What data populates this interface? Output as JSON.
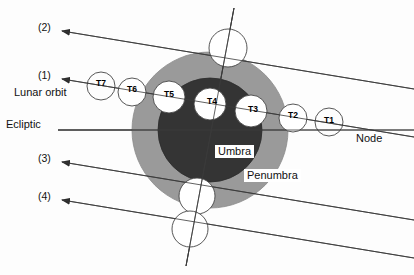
{
  "diagram": {
    "background_color": "#fdfdfd",
    "line_color": "#3a3a3a",
    "text_color": "#111111"
  },
  "regions": [
    {
      "id": "penumbra",
      "label": "Penumbra",
      "color": "#9a9a9a",
      "cx": 210,
      "cy": 130,
      "r": 78,
      "label_x": 244,
      "label_y": 176
    },
    {
      "id": "umbra",
      "label": "Umbra",
      "color": "#343434",
      "cx": 210,
      "cy": 130,
      "r": 52,
      "label_x": 215,
      "label_y": 152
    }
  ],
  "reference_lines": [
    {
      "id": "ecliptic",
      "label": "Ecliptic",
      "label_x": 6,
      "label_y": 124,
      "orientation": "horizontal"
    },
    {
      "id": "node",
      "label": "Node",
      "label_x": 356,
      "label_y": 138,
      "orientation": "on-lunar-orbit"
    },
    {
      "id": "lunar-orbit",
      "label": "Lunar orbit",
      "label_x": 14,
      "label_y": 92,
      "orientation": "tilted"
    }
  ],
  "callouts": [
    {
      "id": "callout-2",
      "label": "(2)",
      "label_x": 38,
      "label_y": 27,
      "arrow_x": 62,
      "arrow_y": 31
    },
    {
      "id": "callout-1",
      "label": "(1)",
      "label_x": 38,
      "label_y": 75,
      "arrow_x": 62,
      "arrow_y": 79
    },
    {
      "id": "callout-3",
      "label": "(3)",
      "label_x": 38,
      "label_y": 158,
      "arrow_x": 62,
      "arrow_y": 162
    },
    {
      "id": "callout-4",
      "label": "(4)",
      "label_x": 38,
      "label_y": 196,
      "arrow_x": 62,
      "arrow_y": 200
    }
  ],
  "moon_positions": [
    {
      "id": "T1",
      "label": "T1",
      "cx": 329,
      "cy": 122,
      "r": 14,
      "fill": "none"
    },
    {
      "id": "T2",
      "label": "T2",
      "cx": 293,
      "cy": 118,
      "r": 14,
      "fill": "white"
    },
    {
      "id": "T3",
      "label": "T3",
      "cx": 251,
      "cy": 111,
      "r": 16,
      "fill": "white"
    },
    {
      "id": "T4",
      "label": "T4",
      "cx": 210,
      "cy": 104,
      "r": 16,
      "fill": "white"
    },
    {
      "id": "T5",
      "label": "T5",
      "cx": 169,
      "cy": 97,
      "r": 16,
      "fill": "white"
    },
    {
      "id": "T6",
      "label": "T6",
      "cx": 132,
      "cy": 92,
      "r": 14,
      "fill": "white"
    },
    {
      "id": "T7",
      "label": "T7",
      "cx": 101,
      "cy": 86,
      "r": 14,
      "fill": "none"
    }
  ],
  "extra_moons": [
    {
      "id": "moon-top",
      "cx": 228,
      "cy": 48,
      "r": 19
    },
    {
      "id": "moon-bottom-1",
      "cx": 197,
      "cy": 196,
      "r": 18
    },
    {
      "id": "moon-bottom-2",
      "cx": 190,
      "cy": 229,
      "r": 18
    }
  ],
  "paths": {
    "line1_lunar_orbit": {
      "x1": 62,
      "y1": 79,
      "x2": 414,
      "y2": 137
    },
    "line2_upper": {
      "x1": 62,
      "y1": 31,
      "x2": 414,
      "y2": 89
    },
    "line3_lower": {
      "x1": 62,
      "y1": 162,
      "x2": 414,
      "y2": 220
    },
    "line4_lowest": {
      "x1": 62,
      "y1": 200,
      "x2": 414,
      "y2": 258
    },
    "ecliptic": {
      "x1": 58,
      "y1": 130,
      "x2": 414,
      "y2": 130
    },
    "tilted_axis": {
      "x1": 234,
      "y1": 8,
      "x2": 186,
      "y2": 266
    }
  }
}
